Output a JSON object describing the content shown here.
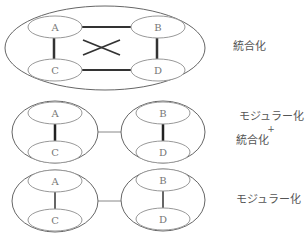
{
  "diagrams": [
    {
      "id": "integration",
      "label": "統合化",
      "nodes": [
        "A",
        "B",
        "C",
        "D"
      ]
    },
    {
      "id": "modular-plus-integration",
      "label_lines": [
        "モジュラー化",
        "+",
        "統合化"
      ],
      "nodes": [
        "A",
        "C",
        "B",
        "D"
      ]
    },
    {
      "id": "modular",
      "label": "モジュラー化",
      "nodes": [
        "A",
        "C",
        "B",
        "D"
      ]
    }
  ],
  "colors": {
    "outline": "#555555",
    "node_outline": "#999999",
    "strong_link": "#333333",
    "text": "#555555"
  }
}
